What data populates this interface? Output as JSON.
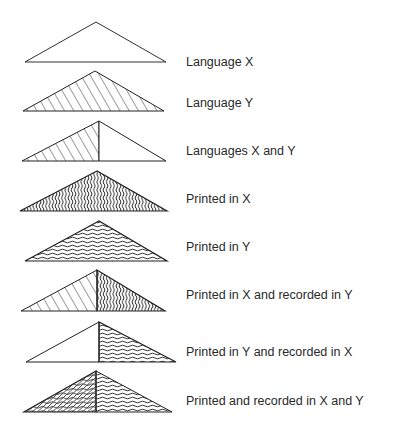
{
  "legend": {
    "items": [
      {
        "id": "language-x",
        "label": "Language X",
        "left": "plain",
        "right": "plain"
      },
      {
        "id": "language-y",
        "label": "Language Y",
        "left": "diagonal",
        "right": "diagonal"
      },
      {
        "id": "languages-x-and-y",
        "label": "Languages X and Y",
        "left": "diagonal",
        "right": "plain"
      },
      {
        "id": "printed-in-x",
        "label": "Printed in X",
        "left": "vertical-wave",
        "right": "vertical-wave"
      },
      {
        "id": "printed-in-y",
        "label": "Printed in Y",
        "left": "horizontal-wave",
        "right": "horizontal-wave"
      },
      {
        "id": "printed-x-recorded-y",
        "label": "Printed in X and recorded in Y",
        "left": "diagonal",
        "right": "vertical-wave"
      },
      {
        "id": "printed-y-recorded-x",
        "label": "Printed in Y and recorded in X",
        "left": "plain",
        "right": "horizontal-wave"
      },
      {
        "id": "printed-recorded-x-and-y",
        "label": "Printed and recorded in X and Y",
        "left": "crosshatch-wave",
        "right": "horizontal-wave"
      }
    ]
  },
  "colors": {
    "stroke": "#222222",
    "background": "#ffffff",
    "text": "#2a2a2a"
  }
}
